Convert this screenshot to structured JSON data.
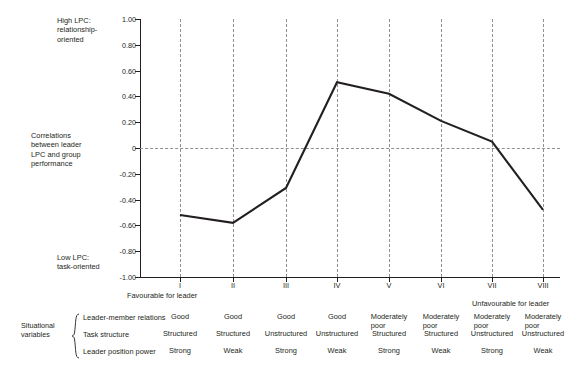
{
  "axes": {
    "y_labels": [
      "1.00",
      "0.80",
      "0.60",
      "0.40",
      "0.20",
      "0",
      "-0.20",
      "-0.40",
      "-0.60",
      "-0.80",
      "-1.00"
    ],
    "y_values": [
      1.0,
      0.8,
      0.6,
      0.4,
      0.2,
      0,
      -0.2,
      -0.4,
      -0.6,
      -0.8,
      -1.0
    ],
    "x_labels": [
      "I",
      "II",
      "III",
      "IV",
      "V",
      "VI",
      "VII",
      "VIII"
    ]
  },
  "annotations": {
    "high_lpc": "High LPC:\nrelationship-\noriented",
    "high_lpc_l1": "High LPC:",
    "high_lpc_l2": "relationship-",
    "high_lpc_l3": "oriented",
    "correlations_l1": "Correlations",
    "correlations_l2": "between leader",
    "correlations_l3": "LPC and group",
    "correlations_l4": "performance",
    "low_lpc_l1": "Low LPC:",
    "low_lpc_l2": "task-oriented",
    "favourable": "Favourable for leader",
    "unfavourable": "Unfavourable for leader"
  },
  "matrix": {
    "group_label_l1": "Situational",
    "group_label_l2": "variables",
    "rows": [
      {
        "name": "Leader-member relations",
        "values": [
          "Good",
          "Good",
          "Good",
          "Good",
          "Moderately\npoor",
          "Moderately\npoor",
          "Moderately\npoor",
          "Moderately\npoor"
        ]
      },
      {
        "name": "Task structure",
        "values": [
          "Structured",
          "Structured",
          "Unstructured",
          "Unstructured",
          "Structured",
          "Structured",
          "Unstructured",
          "Unstructured"
        ]
      },
      {
        "name": "Leader position power",
        "values": [
          "Strong",
          "Weak",
          "Strong",
          "Weak",
          "Strong",
          "Weak",
          "Strong",
          "Weak"
        ]
      }
    ]
  },
  "colors": {
    "line": "#231f20",
    "grid": "#8f9093",
    "text": "#231f20",
    "background": "#ffffff"
  },
  "chart_data": {
    "type": "line",
    "title": "",
    "xlabel": "",
    "ylabel": "Correlations between leader LPC and group performance",
    "ylim": [
      -1.0,
      1.0
    ],
    "grid": true,
    "legend": "none",
    "categories": [
      "I",
      "II",
      "III",
      "IV",
      "V",
      "VI",
      "VII",
      "VIII"
    ],
    "values": [
      -0.52,
      -0.58,
      -0.31,
      0.51,
      0.42,
      0.21,
      0.05,
      -0.48
    ],
    "series": [
      {
        "name": "Correlation between leader LPC and group performance",
        "values": [
          -0.52,
          -0.58,
          -0.31,
          0.51,
          0.42,
          0.21,
          0.05,
          -0.48
        ]
      }
    ],
    "ytick_labels": [
      "1.00",
      "0.80",
      "0.60",
      "0.40",
      "0.20",
      "0",
      "-0.20",
      "-0.40",
      "-0.60",
      "-0.80",
      "-1.00"
    ],
    "annotations": [
      "High LPC: relationship-oriented",
      "Low LPC: task-oriented",
      "Favourable for leader",
      "Unfavourable for leader"
    ]
  }
}
